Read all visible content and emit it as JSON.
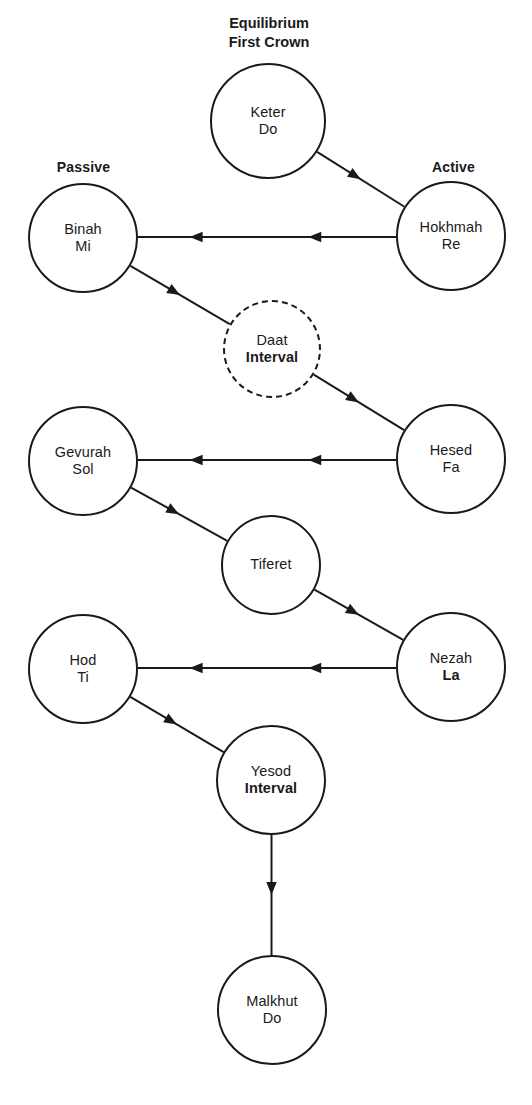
{
  "diagram": {
    "title_block": {
      "line1": "Equilibrium",
      "line2": "First Crown"
    },
    "pillar_labels": {
      "left": "Passive",
      "right": "Active"
    },
    "colors": {
      "stroke": "#1a1a1a",
      "background": "#ffffff"
    },
    "nodes": [
      {
        "id": "keter",
        "line1": "Keter",
        "line2": "Do",
        "bold_line2": false,
        "border": "solid",
        "cx": 268,
        "cy": 121,
        "r": 58
      },
      {
        "id": "binah",
        "line1": "Binah",
        "line2": "Mi",
        "bold_line2": false,
        "border": "solid",
        "cx": 83,
        "cy": 238,
        "r": 55
      },
      {
        "id": "hokhmah",
        "line1": "Hokhmah",
        "line2": "Re",
        "bold_line2": false,
        "border": "solid",
        "cx": 451,
        "cy": 236,
        "r": 55
      },
      {
        "id": "daat",
        "line1": "Daat",
        "line2": "Interval",
        "bold_line2": true,
        "border": "dashed",
        "cx": 272,
        "cy": 349,
        "r": 49
      },
      {
        "id": "gevurah",
        "line1": "Gevurah",
        "line2": "Sol",
        "bold_line2": false,
        "border": "solid",
        "cx": 83,
        "cy": 461,
        "r": 55
      },
      {
        "id": "hesed",
        "line1": "Hesed",
        "line2": "Fa",
        "bold_line2": false,
        "border": "solid",
        "cx": 451,
        "cy": 459,
        "r": 55
      },
      {
        "id": "tiferet",
        "line1": "Tiferet",
        "line2": "",
        "bold_line2": false,
        "border": "solid",
        "cx": 271,
        "cy": 565,
        "r": 50
      },
      {
        "id": "hod",
        "line1": "Hod",
        "line2": "Ti",
        "bold_line2": false,
        "border": "solid",
        "cx": 83,
        "cy": 669,
        "r": 55
      },
      {
        "id": "nezah",
        "line1": "Nezah",
        "line2": "La",
        "bold_line2": true,
        "border": "solid",
        "cx": 451,
        "cy": 667,
        "r": 55
      },
      {
        "id": "yesod",
        "line1": "Yesod",
        "line2": "Interval",
        "bold_line2": true,
        "border": "solid",
        "cx": 271,
        "cy": 780,
        "r": 55
      },
      {
        "id": "malkhut",
        "line1": "Malkhut",
        "line2": "Do",
        "bold_line2": false,
        "border": "solid",
        "cx": 272,
        "cy": 1010,
        "r": 55
      }
    ],
    "edges": [
      {
        "id": "keter-hokhmah",
        "from": "keter",
        "to": "hokhmah",
        "kind": "diagonal",
        "arrowheads": 1
      },
      {
        "id": "hokhmah-binah",
        "from": "hokhmah",
        "to": "binah",
        "kind": "horizontal",
        "arrowheads": 2
      },
      {
        "id": "binah-daat",
        "from": "binah",
        "to": "daat",
        "kind": "diagonal",
        "arrowheads": 1
      },
      {
        "id": "daat-hesed",
        "from": "daat",
        "to": "hesed",
        "kind": "diagonal",
        "arrowheads": 1
      },
      {
        "id": "hesed-gevurah",
        "from": "hesed",
        "to": "gevurah",
        "kind": "horizontal",
        "arrowheads": 2
      },
      {
        "id": "gevurah-tiferet",
        "from": "gevurah",
        "to": "tiferet",
        "kind": "diagonal",
        "arrowheads": 1
      },
      {
        "id": "tiferet-nezah",
        "from": "tiferet",
        "to": "nezah",
        "kind": "diagonal",
        "arrowheads": 1
      },
      {
        "id": "nezah-hod",
        "from": "nezah",
        "to": "hod",
        "kind": "horizontal",
        "arrowheads": 2
      },
      {
        "id": "hod-yesod",
        "from": "hod",
        "to": "yesod",
        "kind": "diagonal",
        "arrowheads": 1
      },
      {
        "id": "yesod-malkhut",
        "from": "yesod",
        "to": "malkhut",
        "kind": "vertical",
        "arrowheads": 1
      }
    ]
  }
}
